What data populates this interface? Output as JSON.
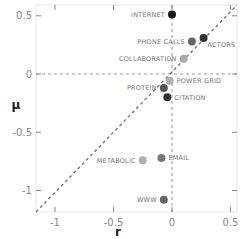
{
  "chart_data": {
    "type": "scatter",
    "title": "",
    "xlabel": "r",
    "ylabel": "μ",
    "xlim": [
      -1.1,
      0.55
    ],
    "ylim": [
      -1.18,
      0.55
    ],
    "xticks": [
      -1,
      -0.5,
      0,
      0.5
    ],
    "yticks": [
      0.5,
      0,
      -0.5,
      -1
    ],
    "xtick_labels": [
      "-1",
      "-0.5",
      "0",
      "0.5"
    ],
    "ytick_labels": [
      "0.5",
      "0",
      "-0.5",
      "-1"
    ],
    "grid": false,
    "reference_lines": [
      {
        "type": "vertical",
        "x": 0,
        "style": "dashed"
      },
      {
        "type": "horizontal",
        "y": 0,
        "style": "dashed"
      },
      {
        "type": "diagonal",
        "slope": 1,
        "intercept": 0,
        "style": "dashed"
      }
    ],
    "points": [
      {
        "label": "INTERNET",
        "r": 0.0,
        "mu": 0.51,
        "color": "#1a1a1a",
        "label_side": "left"
      },
      {
        "label": "PHONE CALLS",
        "r": 0.17,
        "mu": 0.28,
        "color": "#666666",
        "label_side": "left"
      },
      {
        "label": "ACTORS",
        "r": 0.27,
        "mu": 0.31,
        "color": "#333333",
        "label_side": "right-below"
      },
      {
        "label": "COLLABORATION",
        "r": 0.1,
        "mu": 0.13,
        "color": "#aaaaaa",
        "label_side": "left"
      },
      {
        "label": "POWER GRID",
        "r": -0.02,
        "mu": -0.06,
        "color": "#b0b0b0",
        "label_side": "right"
      },
      {
        "label": "PROTEIN",
        "r": -0.07,
        "mu": -0.12,
        "color": "#555555",
        "label_side": "left"
      },
      {
        "label": "CITATION",
        "r": -0.04,
        "mu": -0.2,
        "color": "#333333",
        "label_side": "right"
      },
      {
        "label": "METABOLIC",
        "r": -0.25,
        "mu": -0.74,
        "color": "#b0b0b0",
        "label_side": "left"
      },
      {
        "label": "EMAIL",
        "r": -0.09,
        "mu": -0.72,
        "color": "#777777",
        "label_side": "right"
      },
      {
        "label": "WWW",
        "r": -0.07,
        "mu": -1.08,
        "color": "#666666",
        "label_side": "left"
      }
    ]
  }
}
